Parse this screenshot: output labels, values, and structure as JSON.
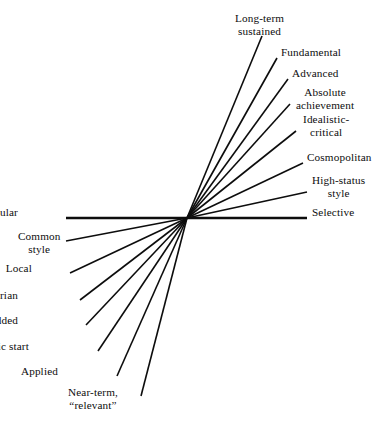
{
  "diagram": {
    "type": "radial-spoke-fan",
    "title": "",
    "center": {
      "x": 187,
      "y": 218
    },
    "stroke_color": "#0d0d0d",
    "background_color": "#ffffff",
    "text_color": "#0d0d0d",
    "spokes": [
      {
        "id": "long-term-sustained",
        "label": "Long-term\nsustained",
        "side": "right",
        "align": "center",
        "end": {
          "x": 262,
          "y": 36
        },
        "label_pos": {
          "x": 235,
          "y": 12
        },
        "width": 1.6
      },
      {
        "id": "fundamental",
        "label": "Fundamental",
        "side": "right",
        "align": "left",
        "end": {
          "x": 277,
          "y": 58
        },
        "label_pos": {
          "x": 281,
          "y": 46
        },
        "width": 1.6
      },
      {
        "id": "advanced",
        "label": "Advanced",
        "side": "right",
        "align": "left",
        "end": {
          "x": 288,
          "y": 79
        },
        "label_pos": {
          "x": 292,
          "y": 67
        },
        "width": 1.6
      },
      {
        "id": "absolute-achievement",
        "label": "Absolute\nachievement",
        "side": "right",
        "align": "center",
        "end": {
          "x": 290,
          "y": 104
        },
        "label_pos": {
          "x": 296,
          "y": 86
        },
        "width": 1.6
      },
      {
        "id": "idealistic-critical",
        "label": "Idealistic-\ncritical",
        "side": "right",
        "align": "center",
        "end": {
          "x": 296,
          "y": 131
        },
        "label_pos": {
          "x": 303,
          "y": 113
        },
        "width": 1.6
      },
      {
        "id": "cosmopolitan",
        "label": "Cosmopolitan",
        "side": "right",
        "align": "left",
        "end": {
          "x": 303,
          "y": 163
        },
        "label_pos": {
          "x": 307,
          "y": 151
        },
        "width": 1.6
      },
      {
        "id": "high-status-style",
        "label": "High-status\nstyle",
        "side": "right",
        "align": "center",
        "end": {
          "x": 307,
          "y": 192
        },
        "label_pos": {
          "x": 312,
          "y": 174
        },
        "width": 1.6
      },
      {
        "id": "selective",
        "label": "Selective",
        "side": "right",
        "align": "left",
        "end": {
          "x": 307,
          "y": 218
        },
        "label_pos": {
          "x": 312,
          "y": 206
        },
        "width": 2.4
      },
      {
        "id": "popular",
        "label": "Popular",
        "side": "left",
        "align": "right",
        "end": {
          "x": 66,
          "y": 218
        },
        "label_pos": {
          "x": 18,
          "y": 206
        },
        "width": 2.4
      },
      {
        "id": "common-style",
        "label": "Common\nstyle",
        "side": "left",
        "align": "center",
        "end": {
          "x": 66,
          "y": 241
        },
        "label_pos": {
          "x": 18,
          "y": 230
        },
        "width": 1.6
      },
      {
        "id": "local",
        "label": "Local",
        "side": "left",
        "align": "right",
        "end": {
          "x": 70,
          "y": 273
        },
        "label_pos": {
          "x": 32,
          "y": 262
        },
        "width": 1.6
      },
      {
        "id": "utilitarian",
        "label": "Utilitarian",
        "side": "left",
        "align": "right",
        "end": {
          "x": 80,
          "y": 300
        },
        "label_pos": {
          "x": 18,
          "y": 289
        },
        "width": 1.6
      },
      {
        "id": "value-added",
        "label": "Value added",
        "side": "left",
        "align": "right",
        "end": {
          "x": 86,
          "y": 325
        },
        "label_pos": {
          "x": 18,
          "y": 314
        },
        "width": 1.6
      },
      {
        "id": "basic-start",
        "label": "Basic start",
        "side": "left",
        "align": "right",
        "end": {
          "x": 98,
          "y": 351
        },
        "label_pos": {
          "x": 29,
          "y": 340
        },
        "width": 1.6
      },
      {
        "id": "applied",
        "label": "Applied",
        "side": "left",
        "align": "right",
        "end": {
          "x": 117,
          "y": 376
        },
        "label_pos": {
          "x": 58,
          "y": 365
        },
        "width": 1.6
      },
      {
        "id": "near-term-relevant",
        "label": "Near-term,\n“relevant”",
        "side": "left",
        "align": "center",
        "end": {
          "x": 141,
          "y": 396
        },
        "label_pos": {
          "x": 68,
          "y": 386
        },
        "width": 1.6
      }
    ]
  }
}
